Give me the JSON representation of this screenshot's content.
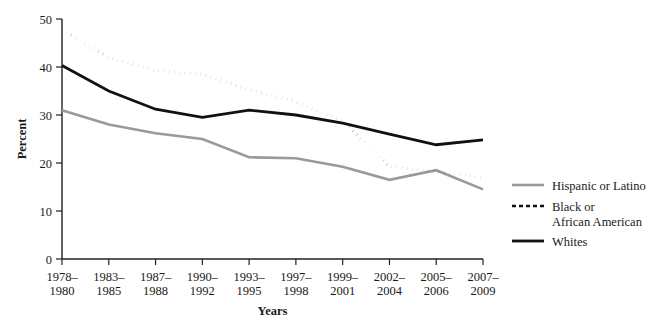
{
  "chart_data": {
    "type": "line",
    "title": "",
    "xlabel": "Years",
    "ylabel": "Percent",
    "ylim": [
      0,
      50
    ],
    "yticks": [
      0,
      10,
      20,
      30,
      40,
      50
    ],
    "grid": false,
    "legend_position": "right",
    "categories": [
      "1978–\n1980",
      "1983–\n1985",
      "1987–\n1988",
      "1990–\n1992",
      "1993–\n1995",
      "1997–\n1998",
      "1999–\n2001",
      "2002–\n2004",
      "2005–\n2006",
      "2007–\n2009"
    ],
    "categories_lines": [
      [
        "1978–",
        "1980"
      ],
      [
        "1983–",
        "1985"
      ],
      [
        "1987–",
        "1988"
      ],
      [
        "1990–",
        "1992"
      ],
      [
        "1993–",
        "1995"
      ],
      [
        "1997–",
        "1998"
      ],
      [
        "1999–",
        "2001"
      ],
      [
        "2002–",
        "2004"
      ],
      [
        "2005–",
        "2006"
      ],
      [
        "2007–",
        "2009"
      ]
    ],
    "series": [
      {
        "name": "Hispanic or Latino",
        "style": "solid",
        "color": "#9a9a9a",
        "width": 2.6,
        "values": [
          31.0,
          28.0,
          26.2,
          25.0,
          21.2,
          21.0,
          19.2,
          16.5,
          18.5,
          14.5
        ]
      },
      {
        "name": "Black or African American",
        "style": "dotted",
        "color": "#111111",
        "width": 2.8,
        "values": [
          47.8,
          42.0,
          39.2,
          38.5,
          35.2,
          32.8,
          28.8,
          19.2,
          18.2,
          17.0
        ]
      },
      {
        "name": "Whites",
        "style": "solid",
        "color": "#111111",
        "width": 2.8,
        "values": [
          40.3,
          35.0,
          31.2,
          29.5,
          31.0,
          30.0,
          28.3,
          26.0,
          23.8,
          24.8
        ]
      }
    ]
  },
  "legend": {
    "entries": [
      {
        "label": "Hispanic or Latino",
        "label_lines": [
          "Hispanic or Latino"
        ]
      },
      {
        "label": "Black or African American",
        "label_lines": [
          "Black or",
          "African American"
        ]
      },
      {
        "label": "Whites",
        "label_lines": [
          "Whites"
        ]
      }
    ]
  },
  "axes": {
    "y_title": "Percent",
    "x_title": "Years",
    "y_tick_labels": [
      "0",
      "10",
      "20",
      "30",
      "40",
      "50"
    ]
  }
}
